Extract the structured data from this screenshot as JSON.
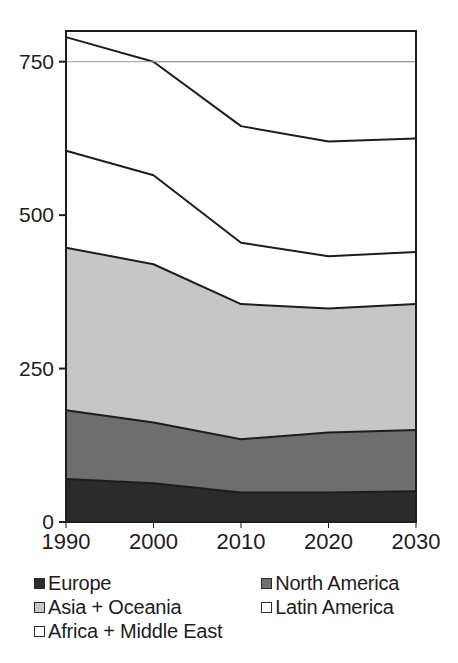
{
  "chart_data": {
    "type": "area",
    "stacked": true,
    "title": "",
    "xlabel": "",
    "ylabel": "",
    "categories": [
      "1990",
      "2000",
      "2010",
      "2020",
      "2030"
    ],
    "x": [
      1990,
      2000,
      2010,
      2020,
      2030
    ],
    "ylim": [
      0,
      800
    ],
    "xlim": [
      1990,
      2030
    ],
    "yticks": [
      0,
      250,
      500,
      750
    ],
    "ytick_labels": [
      "0",
      "250",
      "500",
      "750"
    ],
    "grid": true,
    "gridlines": [
      750
    ],
    "legend_position": "bottom",
    "series": [
      {
        "name": "Europe",
        "color": "#2b2b2b",
        "values": [
          70,
          63,
          48,
          48,
          50
        ]
      },
      {
        "name": "North America",
        "color": "#6e6e6e",
        "values": [
          112,
          99,
          87,
          98,
          100
        ]
      },
      {
        "name": "Asia + Oceania",
        "color": "#c6c6c6",
        "values": [
          265,
          258,
          220,
          202,
          205
        ]
      },
      {
        "name": "Latin America",
        "color": "#ffffff",
        "values": [
          158,
          145,
          100,
          85,
          85
        ]
      },
      {
        "name": "Africa + Middle East",
        "color": "#ffffff",
        "values": [
          185,
          185,
          190,
          187,
          185
        ]
      }
    ],
    "cumulative_totals": {
      "Europe": [
        70,
        63,
        48,
        48,
        50
      ],
      "Europe+NorthAmerica": [
        182,
        162,
        135,
        146,
        150
      ],
      "+Asia+Oceania": [
        447,
        420,
        355,
        348,
        355
      ],
      "+LatinAmerica": [
        605,
        565,
        455,
        433,
        440
      ],
      "total": [
        790,
        750,
        645,
        620,
        625
      ]
    }
  },
  "axis": {
    "y_labels": [
      "750",
      "500",
      "250",
      "0"
    ],
    "x_labels": [
      "1990",
      "2000",
      "2010",
      "2020",
      "2030"
    ]
  },
  "legend": {
    "rows": [
      [
        {
          "label": "Europe",
          "color": "#2b2b2b",
          "swatch": "filled-square-icon"
        },
        {
          "label": "North America",
          "color": "#6e6e6e",
          "swatch": "filled-square-icon"
        }
      ],
      [
        {
          "label": "Asia + Oceania",
          "color": "#c6c6c6",
          "swatch": "filled-square-icon"
        },
        {
          "label": "Latin America",
          "color": "#ffffff",
          "swatch": "empty-square-icon"
        }
      ],
      [
        {
          "label": "Africa + Middle East",
          "color": "#ffffff",
          "swatch": "empty-square-icon"
        }
      ]
    ]
  },
  "colors": {
    "europe": "#2b2b2b",
    "north_america": "#6e6e6e",
    "asia_oceania": "#c6c6c6",
    "latin_america": "#ffffff",
    "africa_middle_east": "#ffffff",
    "axis": "#1d1d1d",
    "gridline": "#9a9a9a",
    "background": "#ffffff"
  }
}
